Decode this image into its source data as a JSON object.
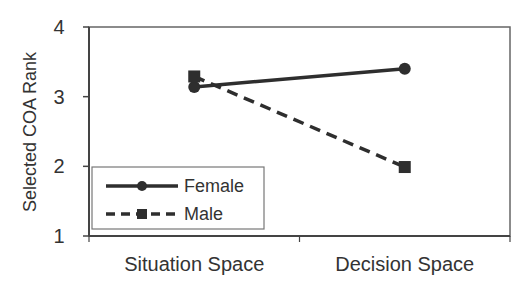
{
  "chart_data": {
    "type": "line",
    "title": "",
    "xlabel": "",
    "ylabel": "Selected COA Rank",
    "categories": [
      "Situation Space",
      "Decision Space"
    ],
    "series": [
      {
        "name": "Female",
        "values": [
          3.14,
          3.4
        ],
        "marker": "circle",
        "line_style": "solid"
      },
      {
        "name": "Male",
        "values": [
          3.29,
          1.99
        ],
        "marker": "square",
        "line_style": "dashed"
      }
    ],
    "ylim": [
      1,
      4
    ],
    "yticks": [
      "1",
      "2",
      "3",
      "4"
    ],
    "grid": false,
    "legend_position": "lower left (inside plot)"
  },
  "colors": {
    "line": "#2e2e2e",
    "frame": "#555555",
    "text": "#333333",
    "background": "#ffffff"
  }
}
